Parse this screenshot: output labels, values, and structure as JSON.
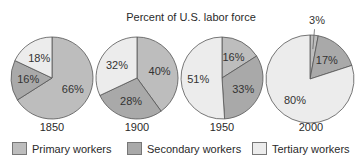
{
  "chart_data": {
    "type": "pie",
    "title": "Percent of U.S. labor force",
    "categories": [
      "Primary workers",
      "Secondary workers",
      "Tertiary workers"
    ],
    "colors": {
      "Primary workers": "#bdbdbd",
      "Secondary workers": "#a9a9a9",
      "Tertiary workers": "#ececec"
    },
    "pies": [
      {
        "label": "1850",
        "values": {
          "Primary workers": 66,
          "Secondary workers": 16,
          "Tertiary workers": 18
        }
      },
      {
        "label": "1900",
        "values": {
          "Primary workers": 40,
          "Secondary workers": 28,
          "Tertiary workers": 32
        }
      },
      {
        "label": "1950",
        "values": {
          "Primary workers": 16,
          "Secondary workers": 33,
          "Tertiary workers": 51
        }
      },
      {
        "label": "2000",
        "values": {
          "Primary workers": 3,
          "Secondary workers": 17,
          "Tertiary workers": 80
        }
      }
    ],
    "legend_position": "bottom"
  },
  "legend": [
    {
      "label": "Primary workers",
      "color": "#bdbdbd"
    },
    {
      "label": "Secondary workers",
      "color": "#a9a9a9"
    },
    {
      "label": "Tertiary workers",
      "color": "#ececec"
    }
  ]
}
